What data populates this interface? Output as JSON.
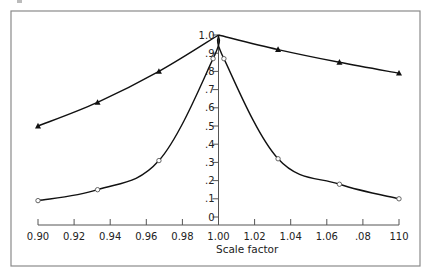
{
  "chart_data": {
    "type": "line",
    "title": "",
    "xlabel": "Scale factor",
    "ylabel": "",
    "xlim": [
      0.9,
      1.1
    ],
    "ylim": [
      0,
      1.0
    ],
    "grid": false,
    "legend": null,
    "x_ticks": [
      "0.90",
      "0.92",
      "0.94",
      "0.96",
      "0.98",
      "1.00",
      "1.02",
      "1.04",
      "1.06",
      ".08",
      "110"
    ],
    "y_ticks": [
      "0",
      ".1",
      ".2",
      ".3",
      ".4",
      ".5",
      ".6",
      ".7",
      ".8",
      ".9",
      "1.0"
    ],
    "series": [
      {
        "name": "filled triangles",
        "marker": "triangle",
        "x": [
          0.9,
          0.933,
          0.967,
          1.0,
          1.033,
          1.067,
          1.1
        ],
        "y": [
          0.5,
          0.63,
          0.8,
          1.0,
          0.92,
          0.85,
          0.79
        ]
      },
      {
        "name": "open circles",
        "marker": "circle",
        "x": [
          0.9,
          0.933,
          0.967,
          0.997,
          1.0,
          1.003,
          1.033,
          1.067,
          1.1
        ],
        "y": [
          0.09,
          0.15,
          0.31,
          0.87,
          1.0,
          0.87,
          0.32,
          0.18,
          0.1
        ]
      }
    ]
  },
  "axis": {
    "x_title": "Scale factor"
  }
}
